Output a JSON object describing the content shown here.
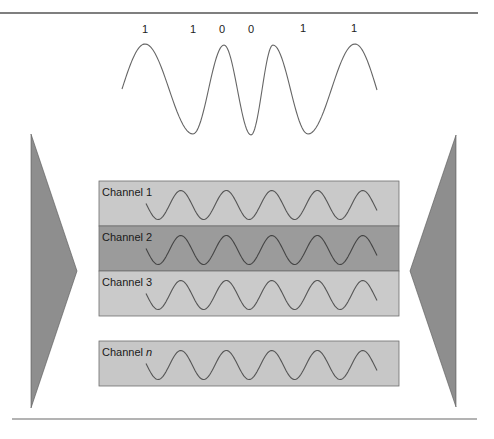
{
  "diagram": {
    "rules": {
      "top": {
        "x1": 0,
        "x2": 478,
        "y": 13,
        "color": "#555555"
      },
      "bottom": {
        "x1": 12,
        "x2": 477,
        "y": 419,
        "color": "#9a9a9a"
      }
    },
    "bit_sequence": {
      "bits": [
        {
          "label": "1",
          "x": 145,
          "y": 33
        },
        {
          "label": "1",
          "x": 193,
          "y": 33
        },
        {
          "label": "0",
          "x": 222,
          "y": 33
        },
        {
          "label": "0",
          "x": 251,
          "y": 33
        },
        {
          "label": "1",
          "x": 303,
          "y": 32
        },
        {
          "label": "1",
          "x": 354,
          "y": 32
        }
      ]
    },
    "fsk_wave": {
      "color": "#666666",
      "points": [
        [
          122,
          89
        ],
        [
          145,
          44
        ],
        [
          193,
          134
        ],
        [
          224,
          45
        ],
        [
          251,
          135
        ],
        [
          273,
          45
        ],
        [
          308,
          134
        ],
        [
          355,
          44
        ],
        [
          377,
          90
        ]
      ]
    },
    "left_triangle": {
      "points": [
        [
          31,
          134
        ],
        [
          77,
          271
        ],
        [
          31,
          408
        ]
      ],
      "color": "#8e8e8e",
      "label": "Multiplexer"
    },
    "right_triangle": {
      "points": [
        [
          456,
          135
        ],
        [
          410,
          271
        ],
        [
          456,
          407
        ]
      ],
      "color": "#8e8e8e",
      "label": "Demultiplexer"
    },
    "channels": [
      {
        "name": "Channel",
        "suffix": "1",
        "italic_suffix": false,
        "y": 181,
        "height": 45,
        "fill": "#c9c9c9",
        "wave_color": "#555555"
      },
      {
        "name": "Channel",
        "suffix": "2",
        "italic_suffix": false,
        "y": 226,
        "height": 45,
        "fill": "#9b9b9b",
        "wave_color": "#444444"
      },
      {
        "name": "Channel",
        "suffix": "3",
        "italic_suffix": false,
        "y": 271,
        "height": 45,
        "fill": "#cacaca",
        "wave_color": "#555555"
      },
      {
        "name": "Channel",
        "suffix": "n",
        "italic_suffix": true,
        "y": 341,
        "height": 45,
        "fill": "#c7c7c7",
        "wave_color": "#555555"
      }
    ],
    "channel_box": {
      "x": 99,
      "width": 300,
      "border": "#6e6e6e"
    },
    "carrier_wave": {
      "x_start": 146,
      "x_end": 377,
      "period": 45.5,
      "amplitude": 14.5,
      "phase_start_offset": -0.3
    }
  }
}
